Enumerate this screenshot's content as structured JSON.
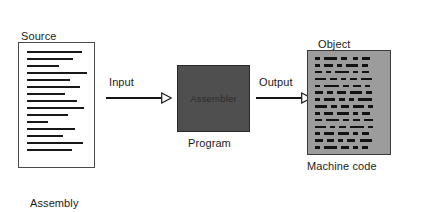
{
  "diagram": {
    "type": "flow-diagram"
  },
  "source": {
    "title_line1": "Source",
    "title_line2": "Program",
    "caption_line1": "Assembly",
    "caption_line2": "Language",
    "doc_line_widths": [
      88,
      74,
      52,
      96,
      70,
      86,
      62,
      80,
      92,
      66,
      34,
      78,
      58,
      90,
      72
    ]
  },
  "input_arrow": {
    "label": "Input",
    "icon": "arrow-right-hollow-icon"
  },
  "assembler": {
    "box_label": "Assembler",
    "caption": "Program"
  },
  "output_arrow": {
    "label": "Output",
    "icon": "arrow-right-hollow-icon"
  },
  "object": {
    "title_line1": "Object",
    "title_line2": "Program",
    "caption": "Machine code",
    "machine_code_rows": [
      [
        4,
        3,
        9,
        3,
        5,
        4,
        4,
        3,
        6
      ],
      [
        4,
        3,
        6,
        3,
        4,
        3,
        9,
        3,
        4
      ],
      [
        5,
        3,
        4,
        3,
        10,
        3,
        4,
        3,
        5
      ],
      [
        8,
        3,
        5,
        3,
        4,
        3,
        5,
        3,
        8
      ],
      [
        4,
        3,
        11,
        3,
        4,
        3,
        6,
        3,
        4
      ],
      [
        6,
        3,
        4,
        3,
        7,
        3,
        9,
        3,
        4
      ],
      [
        4,
        3,
        8,
        3,
        4,
        3,
        4,
        3,
        10
      ],
      [
        9,
        3,
        4,
        3,
        6,
        3,
        8,
        3,
        4
      ],
      [
        4,
        3,
        6,
        3,
        9,
        3,
        4,
        3,
        6
      ],
      [
        5,
        3,
        10,
        3,
        4,
        3,
        5,
        3,
        7
      ],
      [
        8,
        3,
        4,
        3,
        5,
        3,
        10,
        3,
        4
      ],
      [
        4,
        3,
        7,
        3,
        8,
        3,
        4,
        3,
        5
      ],
      [
        6,
        3,
        5,
        3,
        4,
        3,
        6,
        3,
        9
      ],
      [
        4,
        3,
        9,
        3,
        6,
        3,
        4,
        3,
        4
      ]
    ]
  },
  "colors": {
    "page_background": "#ffffff",
    "source_doc_fill": "#ffffff",
    "source_doc_border": "#4a4a4a",
    "source_line": "#181818",
    "assembler_fill": "#4f4f4f",
    "assembler_border": "#2a2a2a",
    "assembler_text": "#2c2c2c",
    "object_fill": "#9c9c9c",
    "object_border": "#3a3a3a",
    "machine_code_dash": "#121212",
    "arrow": "#161616",
    "text": "#1b1b1b"
  }
}
